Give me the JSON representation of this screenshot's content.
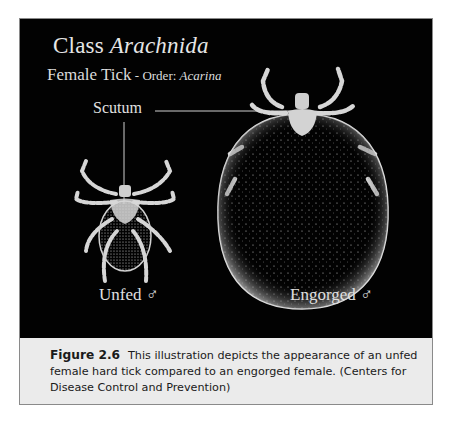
{
  "figure": {
    "title_prefix": "Class ",
    "title_italic": "Arachnida",
    "subtitle_main": "Female Tick",
    "subtitle_dash": " - ",
    "subtitle_order_label": "Order: ",
    "subtitle_order_italic": "Acarina",
    "annotation": "Scutum",
    "left_specimen": {
      "label": "Unfed",
      "symbol": "♂"
    },
    "right_specimen": {
      "label": "Engorged",
      "symbol": "♂"
    },
    "colors": {
      "background": "#020202",
      "drawing": "#d8d8d8",
      "caption_bg": "#ebebeb",
      "border": "#8a8a8a"
    }
  },
  "caption": {
    "number": "Figure 2.6",
    "text": "This illustration depicts the appearance of an unfed female hard tick compared to an engorged female. (Centers for Disease Control and Prevention)"
  }
}
